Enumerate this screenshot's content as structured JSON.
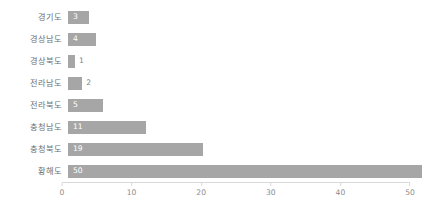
{
  "chart_data": {
    "type": "bar",
    "orientation": "horizontal",
    "title": "",
    "subtitle": "",
    "xlabel": "",
    "ylabel": "",
    "xlim": [
      0,
      50
    ],
    "xticks": [
      0,
      10,
      20,
      30,
      40,
      50
    ],
    "xtick_labels": [
      "0",
      "10",
      "20",
      "30",
      "40",
      "50"
    ],
    "grid": false,
    "legend": false,
    "legend_position": "none",
    "bar_color": "#a6a6a6",
    "label_color_inside": "#ffffff",
    "label_color_outside": "#808080",
    "axis_color": "#d9d9d9",
    "tick_text_color": "#8c8c8c",
    "category_text_color": "#6f6f6f",
    "background_color": "#ffffff",
    "categories": [
      "경기도",
      "경상남도",
      "경상북도",
      "전라남도",
      "전라북도",
      "충청남도",
      "충청북도",
      "황해도"
    ],
    "values": [
      3,
      4,
      1,
      2,
      5,
      11,
      19,
      50
    ],
    "value_labels": [
      "3",
      "4",
      "1",
      "2",
      "5",
      "11",
      "19",
      "50"
    ],
    "label_placement": [
      "inside",
      "inside",
      "outside",
      "outside",
      "inside",
      "inside",
      "inside",
      "inside"
    ],
    "bars": [
      {
        "category": "경기도",
        "value": 3,
        "label": "3",
        "placement": "inside"
      },
      {
        "category": "경상남도",
        "value": 4,
        "label": "4",
        "placement": "inside"
      },
      {
        "category": "경상북도",
        "value": 1,
        "label": "1",
        "placement": "outside"
      },
      {
        "category": "전라남도",
        "value": 2,
        "label": "2",
        "placement": "outside"
      },
      {
        "category": "전라북도",
        "value": 5,
        "label": "5",
        "placement": "inside"
      },
      {
        "category": "충청남도",
        "value": 11,
        "label": "11",
        "placement": "inside"
      },
      {
        "category": "충청북도",
        "value": 19,
        "label": "19",
        "placement": "inside"
      },
      {
        "category": "황해도",
        "value": 50,
        "label": "50",
        "placement": "inside"
      }
    ]
  }
}
